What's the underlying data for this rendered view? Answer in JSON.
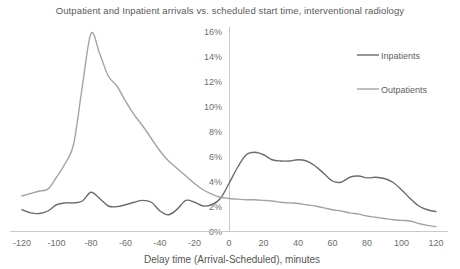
{
  "chart_data": {
    "type": "line",
    "title": "Outpatient and Inpatient arrivals vs. scheduled start time, interventional radiology",
    "xlabel": "Delay time (Arrival-Scheduled), minutes",
    "ylabel": "",
    "xlim": [
      -120,
      120
    ],
    "ylim": [
      0,
      16
    ],
    "grid": false,
    "legend_position": "top-right",
    "x_ticks": [
      "-120",
      "-100",
      "-80",
      "-60",
      "-40",
      "-20",
      "0",
      "20",
      "40",
      "60",
      "80",
      "100",
      "120"
    ],
    "y_ticks": [
      "0%",
      "2%",
      "4%",
      "6%",
      "8%",
      "10%",
      "12%",
      "14%",
      "16%"
    ],
    "x": [
      -120,
      -115,
      -110,
      -105,
      -100,
      -95,
      -90,
      -85,
      -80,
      -75,
      -70,
      -65,
      -60,
      -55,
      -50,
      -45,
      -40,
      -35,
      -30,
      -25,
      -20,
      -15,
      -10,
      -5,
      0,
      5,
      10,
      15,
      20,
      25,
      30,
      35,
      40,
      45,
      50,
      55,
      60,
      65,
      70,
      75,
      80,
      85,
      90,
      95,
      100,
      105,
      110,
      115,
      120
    ],
    "series": [
      {
        "name": "Inpatients",
        "color": "#6b6b6b",
        "values": [
          1.7,
          1.45,
          1.4,
          1.6,
          2.1,
          2.25,
          2.25,
          2.4,
          3.1,
          2.6,
          2.0,
          1.95,
          2.1,
          2.3,
          2.45,
          2.3,
          1.6,
          1.3,
          1.75,
          2.45,
          2.3,
          2.0,
          2.1,
          2.6,
          3.8,
          5.1,
          6.1,
          6.3,
          6.1,
          5.7,
          5.6,
          5.6,
          5.7,
          5.6,
          5.2,
          4.6,
          4.0,
          3.9,
          4.3,
          4.4,
          4.25,
          4.3,
          4.2,
          3.9,
          3.3,
          2.6,
          2.0,
          1.7,
          1.55
        ]
      },
      {
        "name": "Outpatients",
        "color": "#a3a3a3",
        "values": [
          2.8,
          3.0,
          3.2,
          3.35,
          4.3,
          5.4,
          7.0,
          11.6,
          15.8,
          14.2,
          12.4,
          11.6,
          10.4,
          9.3,
          8.4,
          7.4,
          6.4,
          5.6,
          5.0,
          4.4,
          3.8,
          3.3,
          2.95,
          2.7,
          2.6,
          2.55,
          2.5,
          2.5,
          2.45,
          2.4,
          2.3,
          2.25,
          2.2,
          2.1,
          2.0,
          1.85,
          1.7,
          1.6,
          1.45,
          1.35,
          1.2,
          1.1,
          1.0,
          0.9,
          0.85,
          0.8,
          0.6,
          0.45,
          0.35
        ]
      }
    ]
  },
  "axis": {
    "vertical_axis_color": "#c9c9c9",
    "horizontal_axis_color": "#c9c9c9"
  }
}
